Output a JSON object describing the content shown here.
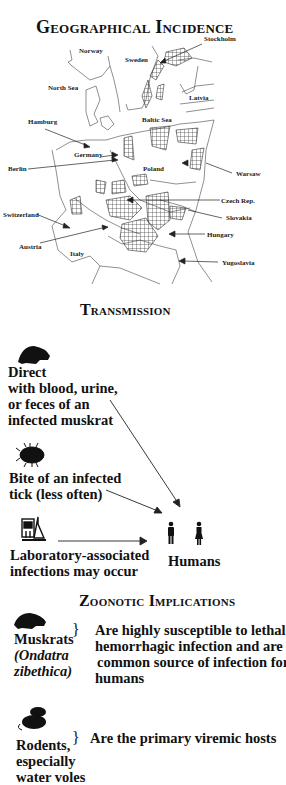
{
  "sections": {
    "geo": {
      "title": "Geographical Incidence",
      "labels": {
        "stockholm": "Stockholm",
        "norway": "Norway",
        "sweden": "Sweden",
        "north_sea": "North Sea",
        "latvia": "Latvia",
        "hamburg": "Hamburg",
        "baltic_sea": "Baltic Sea",
        "germany": "Germany",
        "berlin": "Berlin",
        "poland": "Poland",
        "warsaw": "Warsaw",
        "czech": "Czech Rep.",
        "switzerland": "Switzerland",
        "slovakia": "Slovakia",
        "hungary": "Hungary",
        "austria": "Austria",
        "italy": "Italy",
        "yugoslavia": "Yugoslavia"
      }
    },
    "transmission": {
      "title": "Transmission",
      "direct": [
        "Direct",
        "with blood, urine,",
        "or feces of an",
        "infected muskrat"
      ],
      "tick": [
        "Bite of an infected",
        "tick (less often)"
      ],
      "lab": [
        "Laboratory-associated",
        "infections may occur"
      ],
      "target": "Humans"
    },
    "zoonotic": {
      "title": "Zoonotic Implications",
      "muskrat_label": [
        "Muskrats",
        "(Ondatra",
        "zibethica)"
      ],
      "muskrat_desc": [
        "Are highly susceptible to lethal",
        "hemorrhagic infection and are",
        "common source of infection for",
        "humans"
      ],
      "rodent_label": [
        "Rodents,",
        "especially",
        "water voles"
      ],
      "rodent_desc": "Are the primary viremic hosts",
      "brace": "}"
    }
  },
  "icons": {
    "muskrat": "muskrat-silhouette",
    "tick": "tick-silhouette",
    "lab": "laboratory-equipment",
    "male": "male-figure",
    "female": "female-figure",
    "rodents": "rodents-silhouette"
  }
}
